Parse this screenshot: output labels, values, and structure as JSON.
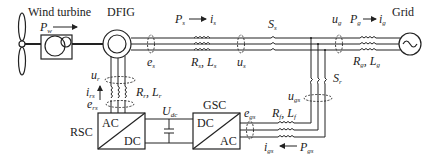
{
  "diagram": {
    "components": {
      "wind_turbine": {
        "label": "Wind turbine",
        "power": "P",
        "power_sub": "w"
      },
      "generator": {
        "label": "DFIG"
      },
      "grid": {
        "label": "Grid"
      },
      "rsc": {
        "label": "RSC",
        "top": "AC",
        "bottom": "DC"
      },
      "gsc": {
        "label": "GSC",
        "top": "DC",
        "bottom": "AC"
      },
      "dc_link": {
        "label": "U",
        "sub": "dc"
      }
    },
    "stator": {
      "power": "P",
      "power_sub": "s",
      "current": "i",
      "current_sub": "s",
      "emf": "e",
      "emf_sub": "s",
      "impedance_R": "R",
      "impedance_R_sub": "s",
      "impedance_L": "L",
      "impedance_L_sub": "s",
      "voltage": "u",
      "voltage_sub": "s",
      "switch": "S",
      "switch_sub": "s"
    },
    "grid_side": {
      "voltage": "u",
      "voltage_sub": "g",
      "power": "P",
      "power_sub": "g",
      "current": "i",
      "current_sub": "g",
      "impedance_R": "R",
      "impedance_R_sub": "g",
      "impedance_L": "L",
      "impedance_L_sub": "g"
    },
    "rotor": {
      "voltage": "u",
      "voltage_sub": "r",
      "current": "i",
      "current_sub": "rs",
      "emf": "e",
      "emf_sub": "rs",
      "impedance_R": "R",
      "impedance_R_sub": "r",
      "impedance_L": "L",
      "impedance_L_sub": "r"
    },
    "filter": {
      "voltage": "u",
      "voltage_sub": "gs",
      "switch": "S",
      "switch_sub": "r",
      "emf": "e",
      "emf_sub": "gs",
      "impedance_R": "R",
      "impedance_R_sub": "f",
      "impedance_L": "L",
      "impedance_L_sub": "f",
      "current": "i",
      "current_sub": "gs",
      "power": "P",
      "power_sub": "gs"
    },
    "separator": ", "
  }
}
